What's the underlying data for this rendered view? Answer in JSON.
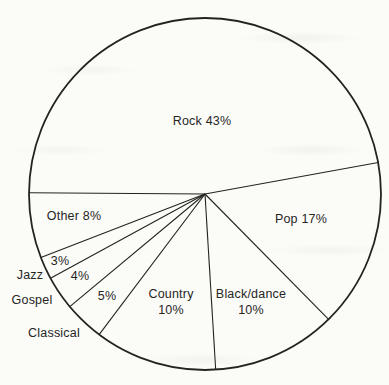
{
  "chart_data": {
    "type": "pie",
    "title": "",
    "labels": [
      "Rock",
      "Pop",
      "Black/dance",
      "Country",
      "Classical",
      "Gospel",
      "Jazz",
      "Other"
    ],
    "values": [
      43,
      17,
      10,
      10,
      5,
      4,
      3,
      8
    ],
    "unit": "%",
    "legend_position": "none",
    "fill_style": "outline only, no slice fills",
    "display_labels": {
      "rock": "Rock 43%",
      "pop": "Pop 17%",
      "other": "Other 8%",
      "jazz_pct": "3%",
      "gospel_pct": "4%",
      "classical_pct": "5%",
      "jazz": "Jazz",
      "gospel": "Gospel",
      "classical": "Classical",
      "country_name": "Country",
      "country_pct": "10%",
      "black_name": "Black/dance",
      "black_pct": "10%"
    },
    "layout": {
      "center_x": 205,
      "center_y": 194,
      "radius": 176,
      "boundary_angles_deg": [
        179.6,
        201.2,
        208.6,
        219.8,
        233.0,
        273.5,
        314.6,
        370.3
      ]
    },
    "colors": {
      "ink": "#23231f",
      "paper": "#fbfbf8"
    }
  }
}
